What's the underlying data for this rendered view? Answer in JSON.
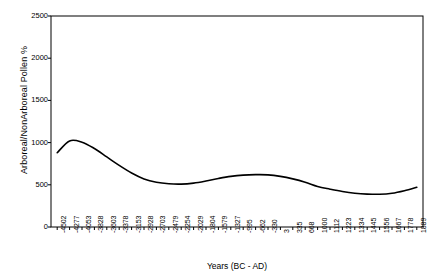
{
  "chart_data": {
    "type": "line",
    "title": "",
    "xlabel": "Years (BC - AD)",
    "ylabel": "Arboreal/NonArboreal Pollen %",
    "ylim": [
      0,
      2500
    ],
    "yticks": [
      0,
      500,
      1000,
      1500,
      2000,
      2500
    ],
    "grid": false,
    "legend": null,
    "line_color": "#000000",
    "frame_color": "#000000",
    "categories": [
      "-4502",
      "-4277",
      "-4053",
      "-3828",
      "-3603",
      "-3378",
      "-3153",
      "-2928",
      "-2703",
      "-2479",
      "-2254",
      "-2029",
      "-1804",
      "-1579",
      "-1327",
      "-995",
      "-662",
      "-330",
      "3",
      "335",
      "668",
      "1000",
      "1112",
      "1223",
      "1334",
      "1445",
      "1556",
      "1667",
      "1778",
      "1889"
    ],
    "values": [
      880,
      1020,
      1005,
      930,
      830,
      730,
      640,
      570,
      530,
      512,
      508,
      520,
      545,
      575,
      600,
      615,
      620,
      618,
      600,
      570,
      530,
      480,
      448,
      420,
      400,
      390,
      388,
      400,
      430,
      470
    ],
    "series": [
      {
        "name": "Arboreal/NonArboreal Pollen %",
        "values": [
          880,
          1020,
          1005,
          930,
          830,
          730,
          640,
          570,
          530,
          512,
          508,
          520,
          545,
          575,
          600,
          615,
          620,
          618,
          600,
          570,
          530,
          480,
          448,
          420,
          400,
          390,
          388,
          400,
          430,
          470
        ]
      }
    ]
  },
  "axes": {
    "ytick_labels": [
      "2500",
      "2000",
      "1500",
      "1000",
      "500",
      "0"
    ],
    "xtick_labels": [
      "-4502",
      "-4277",
      "-4053",
      "-3828",
      "-3603",
      "-3378",
      "-3153",
      "-2928",
      "-2703",
      "-2479",
      "-2254",
      "-2029",
      "-1804",
      "-1579",
      "-1327",
      "-995",
      "-662",
      "-330",
      "3",
      "335",
      "668",
      "1000",
      "1112",
      "1223",
      "1334",
      "1445",
      "1556",
      "1667",
      "1778",
      "1889"
    ],
    "y_axis_title": "Arboreal/NonArboreal Pollen %",
    "x_axis_title": "Years (BC - AD)"
  }
}
